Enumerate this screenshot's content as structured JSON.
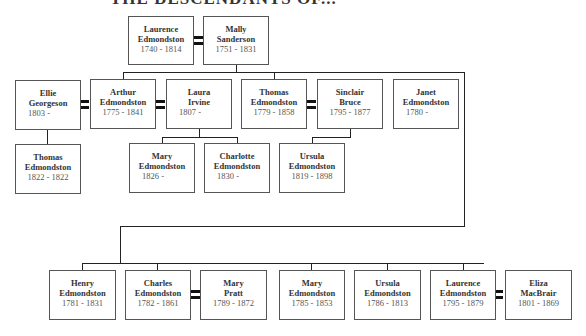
{
  "title": "THE DESCENDANTS OF...",
  "persons": {
    "laurence_sr": {
      "first": "Laurence",
      "last": "Edmondston",
      "dates": "1740 - 1814"
    },
    "mally": {
      "first": "Mally",
      "last": "Sanderson",
      "dates": "1751 - 1831"
    },
    "ellie": {
      "first": "Ellie",
      "last": "Georgeson",
      "dates": "1803 -"
    },
    "arthur": {
      "first": "Arthur",
      "last": "Edmondston",
      "dates": "1775 - 1841"
    },
    "laura": {
      "first": "Laura",
      "last": "Irvine",
      "dates": "1807 -"
    },
    "thomas_sr": {
      "first": "Thomas",
      "last": "Edmondston",
      "dates": "1779 - 1858"
    },
    "sinclair": {
      "first": "Sinclair",
      "last": "Bruce",
      "dates": "1795 - 1877"
    },
    "janet": {
      "first": "Janet",
      "last": "Edmondston",
      "dates": "1780 -"
    },
    "thomas_jr": {
      "first": "Thomas",
      "last": "Edmondston",
      "dates": "1822 - 1822"
    },
    "mary_1826": {
      "first": "Mary",
      "last": "Edmondston",
      "dates": "1826 -"
    },
    "charlotte": {
      "first": "Charlotte",
      "last": "Edmondston",
      "dates": "1830 -"
    },
    "ursula_1819": {
      "first": "Ursula",
      "last": "Edmondston",
      "dates": "1819 - 1898"
    },
    "henry": {
      "first": "Henry",
      "last": "Edmondston",
      "dates": "1781 - 1831"
    },
    "charles": {
      "first": "Charles",
      "last": "Edmondston",
      "dates": "1782 - 1861"
    },
    "mary_pratt": {
      "first": "Mary",
      "last": "Pratt",
      "dates": "1789 - 1872"
    },
    "mary_1785": {
      "first": "Mary",
      "last": "Edmondston",
      "dates": "1785 - 1853"
    },
    "ursula_1786": {
      "first": "Ursula",
      "last": "Edmondston",
      "dates": "1786 - 1813"
    },
    "laurence_jr": {
      "first": "Laurence",
      "last": "Edmondston",
      "dates": "1795 - 1879"
    },
    "eliza": {
      "first": "Eliza",
      "last": "MacBrair",
      "dates": "1801 - 1869"
    }
  }
}
